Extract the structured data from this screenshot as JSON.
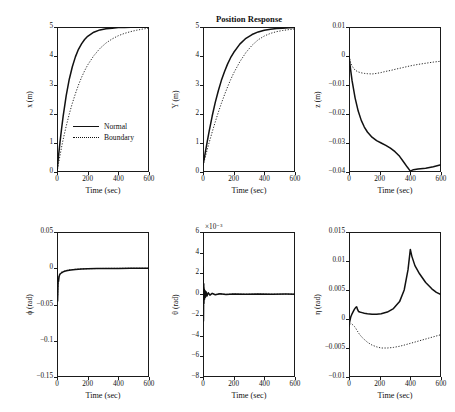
{
  "figure": {
    "title": "Position Response",
    "legend": [
      {
        "label": "Normal",
        "style": "solid"
      },
      {
        "label": "Boundary",
        "style": "dotted"
      }
    ]
  },
  "chart_data": [
    {
      "id": "x-position",
      "type": "line",
      "title": "",
      "xlabel": "Time (sec)",
      "ylabel": "x (m)",
      "xlim": [
        0,
        600
      ],
      "ylim": [
        0,
        5
      ],
      "xticks": [
        0,
        200,
        400,
        600
      ],
      "yticks": [
        0,
        1,
        2,
        3,
        4,
        5
      ],
      "xticklabels": [
        "0",
        "200",
        "400",
        "600"
      ],
      "yticklabels": [
        "0",
        "1",
        "2",
        "3",
        "4",
        "5"
      ],
      "grid": false,
      "legend_position": "lower-right-inside",
      "series": [
        {
          "name": "Normal",
          "style": "solid",
          "x": [
            0,
            10,
            20,
            30,
            40,
            60,
            80,
            100,
            120,
            140,
            160,
            180,
            200,
            240,
            280,
            320,
            360,
            400,
            440,
            480,
            520,
            560,
            600
          ],
          "y": [
            0,
            0.55,
            1.05,
            1.5,
            1.92,
            2.63,
            3.2,
            3.63,
            3.97,
            4.23,
            4.42,
            4.57,
            4.68,
            4.82,
            4.9,
            4.94,
            4.96,
            4.98,
            4.98,
            4.99,
            4.99,
            5.0,
            5.0
          ]
        },
        {
          "name": "Boundary",
          "style": "dotted",
          "x": [
            0,
            10,
            20,
            30,
            40,
            60,
            80,
            100,
            120,
            140,
            160,
            180,
            200,
            240,
            280,
            320,
            360,
            400,
            440,
            480,
            520,
            560,
            600
          ],
          "y": [
            0,
            0.3,
            0.58,
            0.86,
            1.12,
            1.58,
            2.0,
            2.37,
            2.7,
            3.0,
            3.26,
            3.49,
            3.69,
            4.01,
            4.26,
            4.45,
            4.59,
            4.7,
            4.78,
            4.84,
            4.89,
            4.93,
            4.96
          ]
        }
      ]
    },
    {
      "id": "y-position",
      "type": "line",
      "title": "Position Response",
      "xlabel": "Time (sec)",
      "ylabel": "Y (m)",
      "xlim": [
        0,
        600
      ],
      "ylim": [
        0,
        5
      ],
      "xticks": [
        0,
        200,
        400,
        600
      ],
      "yticks": [
        0,
        1,
        2,
        3,
        4,
        5
      ],
      "xticklabels": [
        "0",
        "200",
        "400",
        "600"
      ],
      "yticklabels": [
        "0",
        "1",
        "2",
        "3",
        "4",
        "5"
      ],
      "grid": false,
      "series": [
        {
          "name": "Normal",
          "style": "solid",
          "x": [
            0,
            10,
            20,
            30,
            40,
            60,
            80,
            100,
            120,
            140,
            160,
            180,
            200,
            240,
            280,
            320,
            360,
            400,
            440,
            480,
            520,
            560,
            600
          ],
          "y": [
            0.25,
            0.52,
            0.82,
            1.12,
            1.4,
            1.93,
            2.4,
            2.8,
            3.16,
            3.46,
            3.72,
            3.94,
            4.12,
            4.41,
            4.61,
            4.74,
            4.83,
            4.89,
            4.92,
            4.95,
            4.96,
            4.97,
            4.98
          ]
        },
        {
          "name": "Boundary",
          "style": "dotted",
          "x": [
            0,
            10,
            20,
            30,
            40,
            60,
            80,
            100,
            120,
            140,
            160,
            180,
            200,
            240,
            280,
            320,
            360,
            400,
            440,
            480,
            520,
            560,
            600
          ],
          "y": [
            0.22,
            0.42,
            0.62,
            0.82,
            1.01,
            1.38,
            1.73,
            2.06,
            2.37,
            2.66,
            2.93,
            3.18,
            3.41,
            3.8,
            4.12,
            4.37,
            4.56,
            4.69,
            4.78,
            4.84,
            4.88,
            4.91,
            4.93
          ]
        }
      ]
    },
    {
      "id": "z-position",
      "type": "line",
      "title": "",
      "xlabel": "Time (sec)",
      "ylabel": "z (m)",
      "xlim": [
        0,
        600
      ],
      "ylim": [
        -0.04,
        0.01
      ],
      "xticks": [
        0,
        200,
        400,
        600
      ],
      "yticks": [
        0.01,
        0,
        -0.01,
        -0.02,
        -0.03,
        -0.04
      ],
      "xticklabels": [
        "0",
        "200",
        "400",
        "600"
      ],
      "yticklabels": [
        "0.01",
        "0",
        "−0.01",
        "−0.02",
        "−0.03",
        "−0.04"
      ],
      "grid": false,
      "series": [
        {
          "name": "Normal",
          "style": "solid",
          "x": [
            0,
            10,
            20,
            40,
            60,
            80,
            100,
            120,
            150,
            180,
            210,
            240,
            270,
            300,
            330,
            360,
            380,
            400,
            420,
            450,
            500,
            550,
            600
          ],
          "y": [
            0,
            -0.0045,
            -0.0085,
            -0.0145,
            -0.019,
            -0.0222,
            -0.0245,
            -0.0262,
            -0.028,
            -0.0292,
            -0.03,
            -0.0308,
            -0.0318,
            -0.033,
            -0.0346,
            -0.0368,
            -0.0383,
            -0.0397,
            -0.0392,
            -0.039,
            -0.0387,
            -0.0382,
            -0.0375
          ]
        },
        {
          "name": "Boundary",
          "style": "dotted",
          "x": [
            0,
            10,
            20,
            40,
            60,
            80,
            100,
            120,
            150,
            180,
            210,
            240,
            270,
            300,
            350,
            400,
            450,
            500,
            550,
            600
          ],
          "y": [
            0,
            -0.0022,
            -0.0035,
            -0.0049,
            -0.0055,
            -0.0058,
            -0.006,
            -0.0061,
            -0.0062,
            -0.006,
            -0.0057,
            -0.0053,
            -0.005,
            -0.0046,
            -0.004,
            -0.0034,
            -0.0029,
            -0.0025,
            -0.0021,
            -0.0018
          ]
        }
      ]
    },
    {
      "id": "phi-angle",
      "type": "line",
      "title": "",
      "xlabel": "Time (sec)",
      "ylabel": "ϕ (rad)",
      "xlim": [
        0,
        600
      ],
      "ylim": [
        -0.15,
        0.05
      ],
      "xticks": [
        0,
        200,
        400,
        600
      ],
      "yticks": [
        0.05,
        0,
        -0.05,
        -0.1,
        -0.15
      ],
      "xticklabels": [
        "0",
        "200",
        "400",
        "600"
      ],
      "yticklabels": [
        "0.05",
        "0",
        "−0.05",
        "−0.1",
        "−0.15"
      ],
      "grid": false,
      "series": [
        {
          "name": "Normal",
          "style": "solid",
          "x": [
            0,
            2,
            4,
            6,
            8,
            10,
            14,
            18,
            24,
            30,
            40,
            55,
            70,
            90,
            120,
            160,
            200,
            260,
            320,
            400,
            480,
            560,
            600
          ],
          "y": [
            0,
            -0.03,
            -0.045,
            -0.028,
            -0.014,
            -0.018,
            -0.011,
            -0.0085,
            -0.0072,
            -0.0062,
            -0.005,
            -0.0038,
            -0.003,
            -0.0023,
            -0.0016,
            -0.001,
            -0.0007,
            -0.0004,
            -0.0003,
            -0.0002,
            -0.0001,
            0,
            0
          ]
        },
        {
          "name": "Boundary",
          "style": "dotted",
          "x": [
            0,
            2,
            4,
            6,
            8,
            10,
            14,
            18,
            24,
            30,
            40,
            55,
            70,
            90,
            120,
            160,
            200,
            260,
            320,
            400,
            480,
            560,
            600
          ],
          "y": [
            0,
            -0.022,
            -0.038,
            -0.024,
            -0.012,
            -0.015,
            -0.0095,
            -0.0075,
            -0.0062,
            -0.0054,
            -0.0044,
            -0.0033,
            -0.0026,
            -0.002,
            -0.0014,
            -0.0009,
            -0.0006,
            -0.0004,
            -0.0002,
            -0.0001,
            0,
            0,
            0
          ]
        }
      ]
    },
    {
      "id": "theta-angle",
      "type": "line",
      "title": "",
      "xlabel": "Time (sec)",
      "ylabel": "θ (rad)",
      "exponent": "×10⁻³",
      "xlim": [
        0,
        600
      ],
      "ylim": [
        -8,
        6
      ],
      "xticks": [
        0,
        200,
        400,
        600
      ],
      "yticks": [
        6,
        4,
        2,
        0,
        -2,
        -4,
        -6,
        -8
      ],
      "xticklabels": [
        "0",
        "200",
        "400",
        "600"
      ],
      "yticklabels": [
        "6",
        "4",
        "2",
        "0",
        "−2",
        "−4",
        "−6",
        "−8"
      ],
      "grid": false,
      "series": [
        {
          "name": "Normal",
          "style": "solid",
          "x": [
            0,
            1,
            2,
            3,
            4,
            5,
            6,
            8,
            10,
            13,
            16,
            20,
            26,
            34,
            45,
            60,
            80,
            110,
            150,
            200,
            280,
            360,
            450,
            540,
            600
          ],
          "y": [
            0,
            2.6,
            0.4,
            -2.6,
            -0.6,
            1.0,
            -0.9,
            0.5,
            -0.5,
            0.35,
            -0.3,
            0.22,
            -0.18,
            0.14,
            -0.1,
            0.08,
            -0.06,
            0.04,
            -0.03,
            0.02,
            -0.015,
            0.01,
            -0.008,
            0.005,
            0
          ]
        },
        {
          "name": "Boundary",
          "style": "dotted",
          "x": [
            0,
            1,
            2,
            3,
            4,
            5,
            6,
            8,
            10,
            13,
            16,
            20,
            26,
            34,
            45,
            60,
            80,
            110,
            150,
            200,
            280,
            360,
            450,
            540,
            600
          ],
          "y": [
            0,
            1.8,
            0.3,
            -1.9,
            -0.4,
            0.7,
            -0.6,
            0.35,
            -0.35,
            0.25,
            -0.2,
            0.15,
            -0.12,
            0.1,
            -0.07,
            0.05,
            -0.04,
            0.03,
            -0.02,
            0.015,
            -0.01,
            0.008,
            -0.005,
            0.003,
            0
          ]
        }
      ]
    },
    {
      "id": "eta-angle",
      "type": "line",
      "title": "",
      "xlabel": "Time (sec)",
      "ylabel": "η (rad)",
      "xlim": [
        0,
        600
      ],
      "ylim": [
        -0.01,
        0.015
      ],
      "xticks": [
        0,
        200,
        400,
        600
      ],
      "yticks": [
        0.015,
        0.01,
        0.005,
        0,
        -0.005,
        -0.01
      ],
      "xticklabels": [
        "0",
        "200",
        "400",
        "600"
      ],
      "yticklabels": [
        "0.015",
        "0.01",
        "0.005",
        "0",
        "−0.005",
        "−0.01"
      ],
      "grid": false,
      "series": [
        {
          "name": "Normal",
          "style": "solid",
          "x": [
            0,
            5,
            12,
            20,
            28,
            36,
            44,
            50,
            56,
            62,
            70,
            85,
            100,
            120,
            150,
            180,
            210,
            250,
            290,
            330,
            360,
            385,
            400,
            410,
            430,
            460,
            500,
            540,
            570,
            600
          ],
          "y": [
            -0.0012,
            -0.0004,
            0.0004,
            0.0009,
            0.0013,
            0.0017,
            0.002,
            0.0021,
            0.0016,
            0.0013,
            0.0012,
            0.0011,
            0.001,
            0.0009,
            0.0008,
            0.0008,
            0.0009,
            0.0012,
            0.0018,
            0.003,
            0.005,
            0.0085,
            0.012,
            0.0108,
            0.0092,
            0.0078,
            0.0063,
            0.0052,
            0.0046,
            0.0042
          ]
        },
        {
          "name": "Boundary",
          "style": "dotted",
          "x": [
            0,
            5,
            12,
            20,
            28,
            36,
            44,
            55,
            70,
            90,
            120,
            150,
            180,
            210,
            250,
            290,
            330,
            360,
            400,
            440,
            480,
            520,
            560,
            600
          ],
          "y": [
            -0.0014,
            -0.001,
            -0.0008,
            -0.0009,
            -0.0011,
            -0.0013,
            -0.0016,
            -0.0021,
            -0.0027,
            -0.0033,
            -0.004,
            -0.0045,
            -0.0048,
            -0.005,
            -0.005,
            -0.0049,
            -0.0047,
            -0.0045,
            -0.0042,
            -0.0039,
            -0.0036,
            -0.0033,
            -0.003,
            -0.0027
          ]
        }
      ]
    }
  ]
}
